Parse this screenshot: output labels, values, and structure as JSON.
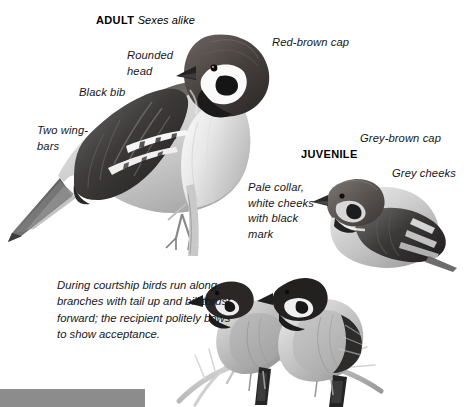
{
  "page": {
    "width": 470,
    "height": 407,
    "background": "#ffffff"
  },
  "headings": {
    "adult": {
      "title": "ADULT",
      "subtitle": "Sexes alike"
    },
    "juvenile": {
      "title": "JUVENILE"
    }
  },
  "labels": {
    "red_brown_cap": "Red-brown cap",
    "rounded_head": "Rounded\nhead",
    "black_bib": "Black bib",
    "two_wing_bars": "Two wing-\nbars",
    "grey_brown_cap": "Grey-brown cap",
    "grey_cheeks": "Grey cheeks",
    "pale_collar": "Pale collar,\nwhite cheeks\nwith black\nmark"
  },
  "caption": {
    "courtship": "During courtship birds run along branches with tail up and bill thrust forward; the recipient politely bows to show acceptance."
  },
  "bottom_bar": {
    "color": "#8c8c8c",
    "width": 145,
    "height": 18
  },
  "illustrations": {
    "adult_bird": "perched-adult-tree-sparrow-illustration",
    "juvenile_bird": "juvenile-tree-sparrow-illustration",
    "courtship_pair": "courtship-pair-on-branch-illustration"
  },
  "colors": {
    "ink": "#16161a",
    "cap_dark": "#4a4442",
    "plumage_mid": "#9a9a9a",
    "plumage_light": "#d8d8d8",
    "black": "#1a1a1a",
    "bar": "#8c8c8c"
  }
}
